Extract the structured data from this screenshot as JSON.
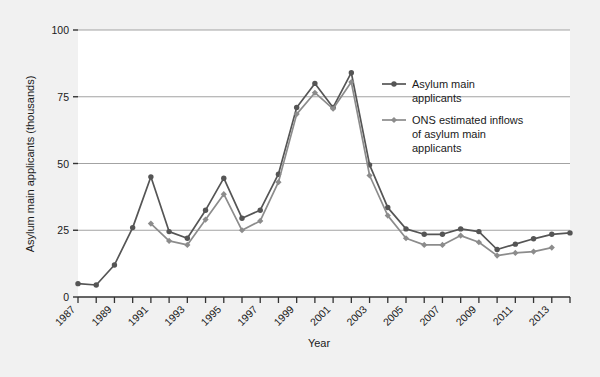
{
  "chart_data": {
    "type": "line",
    "title": "",
    "xlabel": "Year",
    "ylabel": "Asylum main applicants (thousands)",
    "xlim": [
      1987,
      2014
    ],
    "ylim": [
      0,
      100
    ],
    "yticks": [
      0,
      25,
      50,
      75,
      100
    ],
    "ytick_labels": [
      "0",
      "25",
      "50",
      "75",
      "100"
    ],
    "xticks": [
      1987,
      1988,
      1989,
      1990,
      1991,
      1992,
      1993,
      1994,
      1995,
      1996,
      1997,
      1998,
      1999,
      2000,
      2001,
      2002,
      2003,
      2004,
      2005,
      2006,
      2007,
      2008,
      2009,
      2010,
      2011,
      2012,
      2013,
      2014
    ],
    "xtick_labels": [
      "1987",
      "",
      "1989",
      "",
      "1991",
      "",
      "1993",
      "",
      "1995",
      "",
      "1997",
      "",
      "1999",
      "",
      "2001",
      "",
      "2003",
      "",
      "2005",
      "",
      "2007",
      "",
      "2009",
      "",
      "2011",
      "",
      "2013",
      ""
    ],
    "grid": "horizontal",
    "legend_position": "top-right",
    "series": [
      {
        "name": "Asylum main applicants",
        "color": "#555555",
        "marker": "circle",
        "x": [
          1987,
          1988,
          1989,
          1990,
          1991,
          1992,
          1993,
          1994,
          1995,
          1996,
          1997,
          1998,
          1999,
          2000,
          2001,
          2002,
          2003,
          2004,
          2005,
          2006,
          2007,
          2008,
          2009,
          2010,
          2011,
          2012,
          2013,
          2014
        ],
        "values": [
          5.0,
          4.5,
          12.0,
          26.0,
          45.0,
          24.5,
          22.0,
          32.5,
          44.5,
          29.5,
          32.5,
          46.0,
          71.0,
          80.0,
          71.0,
          84.0,
          49.5,
          33.5,
          25.5,
          23.5,
          23.5,
          25.5,
          24.5,
          17.8,
          19.8,
          21.8,
          23.5,
          24.0
        ]
      },
      {
        "name": "ONS estimated inflows of asylum main applicants",
        "color": "#8c8c8c",
        "marker": "diamond",
        "x": [
          1991,
          1992,
          1993,
          1994,
          1995,
          1996,
          1997,
          1998,
          1999,
          2000,
          2001,
          2002,
          2003,
          2004,
          2005,
          2006,
          2007,
          2008,
          2009,
          2010,
          2011,
          2012,
          2013
        ],
        "values": [
          27.5,
          21.0,
          19.5,
          29.0,
          38.5,
          25.0,
          28.5,
          43.0,
          68.5,
          76.5,
          70.5,
          80.5,
          45.5,
          30.5,
          22.0,
          19.5,
          19.5,
          23.0,
          20.5,
          15.5,
          16.5,
          17.0,
          18.5
        ]
      }
    ]
  },
  "legend": {
    "items": [
      {
        "label_lines": [
          "Asylum main",
          "applicants"
        ]
      },
      {
        "label_lines": [
          "ONS estimated inflows",
          "of asylum main",
          "applicants"
        ]
      }
    ]
  },
  "colors": {
    "series1": "#555555",
    "series2": "#8c8c8c",
    "grid": "#999999",
    "axis": "#333333",
    "background": "#f1f1f1",
    "plot_background": "#ffffff"
  }
}
